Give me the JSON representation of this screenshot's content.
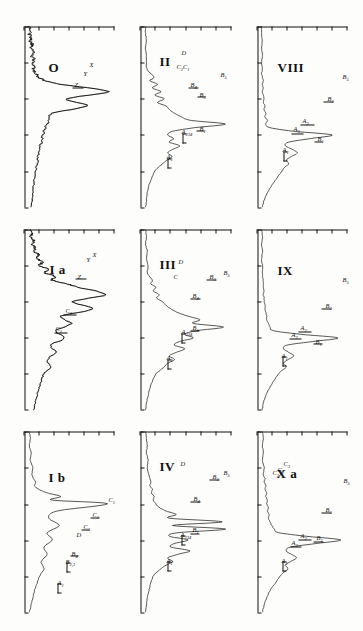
{
  "figure": {
    "orientation": "rotated-90",
    "panel_count": 9,
    "ink_color": "#111111",
    "background_color": "#fdfdfb"
  },
  "chart_data": {
    "type": "line",
    "title": "",
    "xlabel": "",
    "ylabel": "",
    "grid": false,
    "legend": "none",
    "panels": [
      {
        "id": "panel-VIII",
        "label": "VIII",
        "row": 1,
        "col": 1,
        "annotations": [
          "B₅",
          "B₃",
          "B₁",
          "A₂",
          "A₃",
          "A₁"
        ],
        "x": [
          0,
          4,
          8,
          12,
          16,
          20,
          24,
          26,
          28,
          30,
          32,
          34,
          36,
          38,
          40,
          42,
          44,
          46,
          48,
          50,
          52,
          54,
          56,
          58,
          60,
          62,
          64,
          66,
          68,
          70,
          72,
          74,
          76,
          78,
          80,
          84,
          88,
          92,
          96,
          100
        ],
        "y": [
          2,
          2,
          3,
          2,
          3,
          2,
          3,
          2,
          3,
          4,
          3,
          4,
          3,
          4,
          5,
          4,
          6,
          5,
          7,
          6,
          9,
          7,
          12,
          40,
          85,
          60,
          34,
          30,
          38,
          44,
          37,
          31,
          34,
          29,
          26,
          20,
          14,
          9,
          5,
          3
        ]
      },
      {
        "id": "panel-IX",
        "label": "IX",
        "row": 1,
        "col": 2,
        "annotations": [
          "B₅",
          "B₃",
          "B₁",
          "A₂",
          "A₃",
          "A₁"
        ],
        "x": [
          0,
          4,
          8,
          12,
          16,
          20,
          24,
          26,
          28,
          30,
          32,
          34,
          36,
          38,
          40,
          42,
          44,
          46,
          48,
          50,
          52,
          54,
          56,
          58,
          60,
          62,
          64,
          66,
          68,
          70,
          72,
          74,
          76,
          78,
          80,
          84,
          88,
          92,
          96,
          100
        ],
        "y": [
          2,
          3,
          2,
          3,
          2,
          3,
          3,
          3,
          4,
          4,
          4,
          5,
          4,
          5,
          5,
          6,
          6,
          7,
          8,
          8,
          10,
          12,
          16,
          48,
          92,
          62,
          32,
          28,
          34,
          40,
          33,
          28,
          31,
          26,
          22,
          16,
          11,
          7,
          4,
          3
        ]
      },
      {
        "id": "panel-Xa",
        "label": "X a",
        "row": 1,
        "col": 3,
        "annotations": [
          "B₅",
          "B₃",
          "B₁",
          "A₂",
          "A₃",
          "A₁",
          "C₃",
          "C₂",
          "C₁"
        ],
        "x": [
          0,
          4,
          8,
          12,
          16,
          20,
          24,
          26,
          28,
          30,
          32,
          34,
          36,
          38,
          40,
          42,
          44,
          46,
          48,
          50,
          52,
          54,
          56,
          58,
          60,
          62,
          64,
          66,
          68,
          70,
          72,
          74,
          76,
          78,
          80,
          84,
          88,
          92,
          96,
          100
        ],
        "y": [
          3,
          4,
          3,
          4,
          3,
          5,
          4,
          6,
          5,
          7,
          6,
          8,
          7,
          9,
          8,
          10,
          9,
          11,
          10,
          12,
          14,
          17,
          22,
          55,
          95,
          66,
          36,
          31,
          37,
          43,
          36,
          30,
          33,
          28,
          24,
          18,
          12,
          8,
          5,
          3
        ]
      },
      {
        "id": "panel-II",
        "label": "II",
        "row": 2,
        "col": 1,
        "annotations": [
          "D",
          "C₂C₁",
          "B₄",
          "B₃",
          "B₂",
          "B₁",
          "A₂₃₄",
          "A₁"
        ],
        "x": [
          0,
          4,
          8,
          12,
          16,
          20,
          24,
          28,
          30,
          32,
          34,
          36,
          38,
          40,
          42,
          44,
          46,
          48,
          50,
          52,
          54,
          56,
          58,
          60,
          62,
          64,
          66,
          68,
          70,
          72,
          74,
          76,
          78,
          80,
          84,
          88,
          92,
          96,
          100
        ],
        "y": [
          2,
          2,
          3,
          2,
          3,
          3,
          4,
          12,
          7,
          16,
          10,
          20,
          13,
          24,
          16,
          26,
          30,
          36,
          44,
          56,
          96,
          60,
          34,
          28,
          35,
          30,
          42,
          34,
          28,
          33,
          27,
          22,
          17,
          13,
          9,
          6,
          4,
          3,
          2
        ]
      },
      {
        "id": "panel-III",
        "label": "III",
        "row": 2,
        "col": 2,
        "annotations": [
          "D",
          "C",
          "B₄",
          "B₃",
          "B₅",
          "B₁",
          "A₂₃₄",
          "A₁"
        ],
        "x": [
          0,
          4,
          8,
          12,
          16,
          20,
          24,
          28,
          30,
          32,
          34,
          36,
          38,
          40,
          42,
          44,
          46,
          48,
          50,
          52,
          54,
          56,
          58,
          60,
          62,
          64,
          66,
          68,
          70,
          72,
          74,
          76,
          78,
          80,
          84,
          88,
          92,
          96,
          100
        ],
        "y": [
          2,
          3,
          2,
          4,
          3,
          5,
          4,
          10,
          8,
          14,
          11,
          18,
          15,
          22,
          26,
          32,
          40,
          52,
          66,
          58,
          94,
          62,
          48,
          58,
          42,
          36,
          48,
          38,
          30,
          36,
          28,
          24,
          19,
          14,
          10,
          7,
          5,
          3,
          2
        ]
      },
      {
        "id": "panel-IV",
        "label": "IV",
        "row": 2,
        "col": 3,
        "annotations": [
          "D",
          "B₄",
          "B₃",
          "B₅",
          "B₁",
          "A₂₃₄",
          "A₁"
        ],
        "x": [
          0,
          4,
          8,
          12,
          16,
          20,
          24,
          28,
          30,
          32,
          34,
          36,
          38,
          40,
          42,
          44,
          46,
          48,
          50,
          52,
          54,
          56,
          58,
          60,
          62,
          64,
          66,
          68,
          70,
          72,
          74,
          76,
          78,
          80,
          84,
          88,
          92,
          96,
          100
        ],
        "y": [
          2,
          3,
          4,
          3,
          5,
          4,
          6,
          8,
          7,
          10,
          9,
          12,
          11,
          14,
          18,
          26,
          38,
          30,
          92,
          34,
          96,
          40,
          30,
          52,
          36,
          32,
          54,
          40,
          28,
          34,
          26,
          20,
          15,
          11,
          8,
          6,
          4,
          3,
          2
        ]
      },
      {
        "id": "panel-O",
        "label": "O",
        "row": 3,
        "col": 1,
        "annotations": [
          "X",
          "Y",
          "Z"
        ],
        "noisy": true,
        "x": [
          0,
          2,
          4,
          6,
          8,
          10,
          12,
          14,
          16,
          18,
          20,
          22,
          24,
          26,
          28,
          30,
          32,
          36,
          40,
          44,
          48,
          52,
          56,
          60,
          64,
          68,
          72,
          76,
          80,
          84,
          88,
          92,
          96,
          100
        ],
        "y": [
          3,
          4,
          3,
          5,
          4,
          6,
          5,
          7,
          6,
          8,
          7,
          9,
          8,
          11,
          14,
          22,
          40,
          95,
          48,
          70,
          30,
          26,
          22,
          19,
          17,
          15,
          13,
          12,
          10,
          9,
          8,
          7,
          6,
          5
        ]
      },
      {
        "id": "panel-Ia",
        "label": "I a",
        "row": 3,
        "col": 2,
        "annotations": [
          "X",
          "Y",
          "Z",
          "C₂",
          "C₁"
        ],
        "noisy": true,
        "x": [
          0,
          2,
          4,
          6,
          8,
          10,
          12,
          14,
          16,
          18,
          20,
          22,
          24,
          26,
          28,
          30,
          32,
          36,
          40,
          44,
          48,
          52,
          56,
          60,
          64,
          68,
          72,
          76,
          80,
          84,
          88,
          92,
          96,
          100
        ],
        "y": [
          4,
          6,
          5,
          8,
          6,
          10,
          8,
          14,
          11,
          18,
          15,
          26,
          20,
          34,
          30,
          46,
          60,
          92,
          55,
          78,
          40,
          52,
          34,
          44,
          28,
          34,
          24,
          28,
          20,
          17,
          14,
          12,
          10,
          8
        ]
      },
      {
        "id": "panel-Ib",
        "label": "I b",
        "row": 3,
        "col": 3,
        "annotations": [
          "C₁",
          "C₂",
          "C₃",
          "D",
          "B₄",
          "B₂,₃",
          "A₁"
        ],
        "x": [
          0,
          4,
          8,
          12,
          16,
          20,
          24,
          28,
          30,
          32,
          34,
          36,
          38,
          40,
          44,
          48,
          52,
          56,
          60,
          64,
          68,
          72,
          76,
          80,
          84,
          88,
          92,
          96,
          100
        ],
        "y": [
          3,
          4,
          3,
          5,
          4,
          7,
          6,
          10,
          9,
          14,
          24,
          40,
          30,
          95,
          36,
          26,
          38,
          24,
          30,
          20,
          24,
          17,
          20,
          15,
          12,
          9,
          7,
          5,
          3
        ]
      }
    ]
  }
}
